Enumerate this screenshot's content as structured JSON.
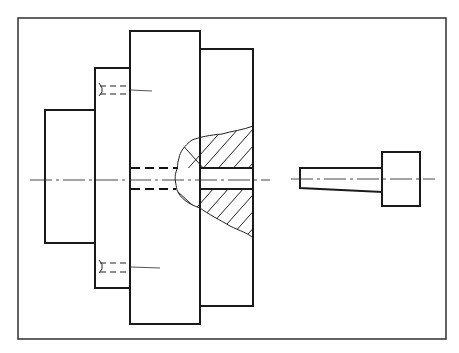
{
  "figure": {
    "type": "technical-drawing",
    "colors": {
      "line": "#1a1a1a",
      "background": "#ffffff"
    },
    "parts": [
      {
        "name": "left-block",
        "label": ""
      },
      {
        "name": "second-block",
        "label": ""
      },
      {
        "name": "center-plate",
        "label": ""
      },
      {
        "name": "right-plate-sectioned",
        "label": ""
      },
      {
        "name": "tapered-pin",
        "label": ""
      }
    ]
  }
}
